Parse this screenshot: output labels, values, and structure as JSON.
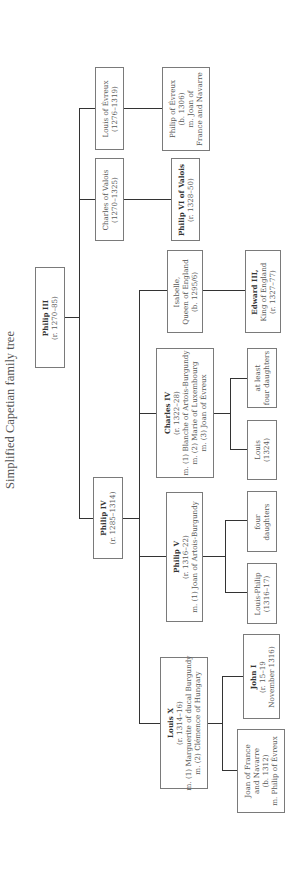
{
  "title": "Simplified Capetian family tree",
  "people": {
    "philip_iii": {
      "name": "Philip III",
      "lines": [
        "(r. 1270–85)"
      ]
    },
    "philip_iv": {
      "name": "Philip IV",
      "lines": [
        "(r. 1285–1314)"
      ]
    },
    "charles_valois": {
      "name": "",
      "lines": [
        "Charles of Valois",
        "(1270–1325)"
      ]
    },
    "louis_evreux": {
      "name": "",
      "lines": [
        "Louis of Évreux",
        "(1276–1319)"
      ]
    },
    "philip_vi": {
      "name": "Philip VI of Valois",
      "lines": [
        "(r. 1328–50)"
      ]
    },
    "philip_evreux": {
      "name": "",
      "lines": [
        "Philip of Évreux",
        "(b. 1306)",
        "m. Joan of",
        "France and Navarre"
      ]
    },
    "isabelle": {
      "name": "",
      "lines": [
        "Isabelle,",
        "Queen of England",
        "(b. 1295/6)"
      ]
    },
    "edward_iii": {
      "name": "Edward III,",
      "lines": [
        "King of England",
        "(r. 1327–77)"
      ]
    },
    "charles_iv": {
      "name": "Charles IV",
      "lines": [
        "(r. 1322–28)",
        "m. (1) Blanche of Artois-Burgundy",
        "m. (2) Marie of Luxembourg",
        "m. (3) Joan of Évreux"
      ]
    },
    "at_least_four_daughters": {
      "name": "",
      "lines": [
        "at least",
        "four daughters"
      ]
    },
    "louis_1324": {
      "name": "",
      "lines": [
        "Louis",
        "(1324)"
      ]
    },
    "philip_v": {
      "name": "Philip V",
      "lines": [
        "(r. 1316–22)",
        "m. (1) Joan of Artois-Burgundy"
      ]
    },
    "four_daughters": {
      "name": "",
      "lines": [
        "four",
        "daughters"
      ]
    },
    "louis_philip": {
      "name": "",
      "lines": [
        "Louis-Philip",
        "(1316–17)"
      ]
    },
    "louis_x": {
      "name": "Louis X",
      "lines": [
        "(r. 1314–16)",
        "m. (1) Marguerite of ducal Burgundy",
        "m. (2) Clémence of Hungary"
      ]
    },
    "john_i": {
      "name": "John I",
      "lines": [
        "(r. 15–19",
        "November 1316)"
      ]
    },
    "joan_france_navarre": {
      "name": "",
      "lines": [
        "Joan of France",
        "and Navarre",
        "(b. 1312)",
        "m. Philip of Évreux"
      ]
    }
  }
}
